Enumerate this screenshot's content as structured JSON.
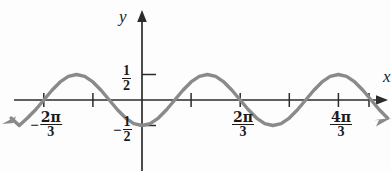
{
  "figure": {
    "background_color": "#fdfdfd",
    "curve_color": "#8a8a8a",
    "axis_color": "#2b2b2b",
    "text_color": "#1b1b1b"
  },
  "axes": {
    "y_axis_name": "y",
    "x_axis_name": "x"
  },
  "y_ticks": [
    {
      "id": "pos-half",
      "numerator": "1",
      "denominator": "2",
      "sign": "",
      "value": 0.5
    },
    {
      "id": "neg-half",
      "numerator": "1",
      "denominator": "2",
      "sign": "−",
      "value": -0.5
    }
  ],
  "x_ticks": [
    {
      "id": "neg-two-pi-thirds",
      "sign": "−",
      "numerator": "2π",
      "denominator": "3",
      "value": -2.0944
    },
    {
      "id": "two-pi-thirds",
      "sign": "",
      "numerator": "2π",
      "denominator": "3",
      "value": 2.0944
    },
    {
      "id": "four-pi-thirds",
      "sign": "",
      "numerator": "4π",
      "denominator": "3",
      "value": 4.1888
    }
  ],
  "chart_data": {
    "type": "line",
    "title": "",
    "xlabel": "x",
    "ylabel": "y",
    "equation": "y = (1/2) sin(3x)",
    "amplitude": 0.5,
    "period": 2.0944,
    "grid": false,
    "legend": null,
    "xlim": [
      -2.7925,
      5.236
    ],
    "ylim": [
      -0.85,
      0.85
    ],
    "x_tick_values": [
      -2.0944,
      -1.0472,
      0,
      1.0472,
      2.0944,
      3.1416,
      4.1888,
      5.236
    ],
    "x_tick_labels": [
      "-2π/3",
      "",
      "",
      "",
      "2π/3",
      "",
      "4π/3",
      ""
    ],
    "y_tick_values": [
      -0.5,
      0.5
    ],
    "y_tick_labels": [
      "-1/2",
      "1/2"
    ],
    "series": [
      {
        "name": "y = (1/2) sin(3x)",
        "color": "#8a8a8a",
        "x": [
          -2.7925,
          -2.618,
          -2.4435,
          -2.269,
          -2.0944,
          -1.9199,
          -1.7453,
          -1.5708,
          -1.3963,
          -1.2217,
          -1.0472,
          -0.8727,
          -0.6981,
          -0.5236,
          -0.3491,
          -0.1745,
          0,
          0.1745,
          0.3491,
          0.5236,
          0.6981,
          0.8727,
          1.0472,
          1.2217,
          1.3963,
          1.5708,
          1.7453,
          1.9199,
          2.0944,
          2.269,
          2.4435,
          2.618,
          2.7925,
          2.9671,
          3.1416,
          3.3161,
          3.4907,
          3.6652,
          3.8397,
          4.0143,
          4.1888,
          4.3633,
          4.5379,
          4.7124,
          4.8869,
          5.0615,
          5.236
        ],
        "y": [
          -0.354,
          -0.5,
          -0.354,
          -0.191,
          0,
          0.191,
          0.354,
          0.462,
          0.5,
          0.462,
          0.354,
          0.191,
          0,
          -0.191,
          -0.354,
          -0.462,
          -0.5,
          -0.462,
          -0.354,
          -0.191,
          0,
          0.191,
          0.354,
          0.462,
          0.5,
          0.462,
          0.354,
          0.191,
          0,
          -0.191,
          -0.354,
          -0.462,
          -0.5,
          -0.462,
          -0.354,
          -0.191,
          0,
          0.191,
          0.354,
          0.462,
          0.5,
          0.462,
          0.354,
          0.191,
          0,
          -0.191,
          -0.354
        ],
        "has_left_arrow": true,
        "has_right_arrow": true
      }
    ]
  }
}
